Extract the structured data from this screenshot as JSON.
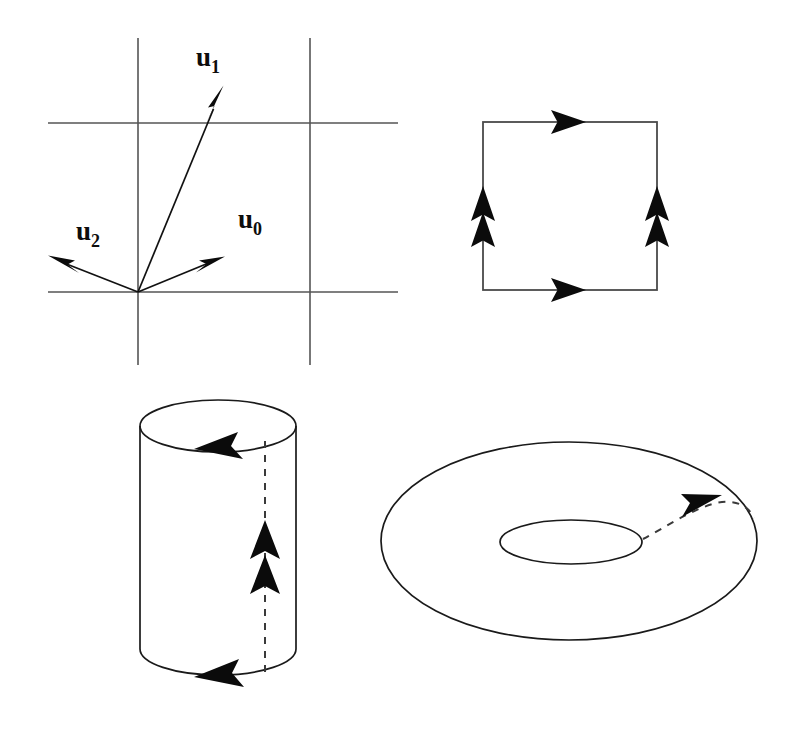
{
  "figure": {
    "background_color": "#ffffff",
    "ink_color": "#111111",
    "grid_color": "#555555",
    "panels": [
      {
        "id": "lattice-vectors",
        "name": "lattice-basis-vectors-panel",
        "position": "top-left",
        "description": "Square grid with three labelled vectors emanating from the origin",
        "grid": {
          "vertical_lines_x": [
            138,
            310
          ],
          "horizontal_lines_y": [
            123,
            292
          ],
          "x_extent": [
            48,
            398
          ],
          "y_extent": [
            38,
            365
          ]
        },
        "origin": [
          138,
          292
        ],
        "vectors": [
          {
            "label": "u",
            "subscript": "0",
            "tip": [
              222,
              258
            ],
            "label_pos": [
              238,
              228
            ]
          },
          {
            "label": "u",
            "subscript": "1",
            "tip": [
              222,
              88
            ],
            "label_pos": [
              196,
              66
            ]
          },
          {
            "label": "u",
            "subscript": "2",
            "tip": [
              50,
              258
            ],
            "label_pos": [
              76,
              240
            ]
          }
        ]
      },
      {
        "id": "identified-square",
        "name": "identified-square-panel",
        "position": "top-right",
        "description": "Square with edge identifications: top and bottom single right arrows, left and right double up arrows",
        "bounds": {
          "left": 483,
          "top": 122,
          "right": 657,
          "bottom": 290
        },
        "edge_markers": [
          {
            "edge": "top",
            "direction": "right",
            "count": 1
          },
          {
            "edge": "bottom",
            "direction": "right",
            "count": 1
          },
          {
            "edge": "left",
            "direction": "up",
            "count": 2
          },
          {
            "edge": "right",
            "direction": "up",
            "count": 2
          }
        ]
      },
      {
        "id": "cylinder",
        "name": "cylinder-panel",
        "position": "bottom-left",
        "description": "Cylinder obtained by gluing the vertical edges; rim arrows point left, dashed seam carries a double up arrow",
        "top_ellipse": {
          "cx": 218,
          "cy": 426,
          "rx": 78,
          "ry": 26
        },
        "bottom_ellipse": {
          "cx": 218,
          "cy": 649,
          "rx": 78,
          "ry": 26
        },
        "seam": {
          "x": 265,
          "top_y": 440,
          "bottom_y": 672,
          "style": "dashed"
        },
        "edge_markers": [
          {
            "edge": "top-rim",
            "direction": "left",
            "count": 1
          },
          {
            "edge": "bottom-rim",
            "direction": "left",
            "count": 1
          },
          {
            "edge": "seam",
            "direction": "up",
            "count": 2
          }
        ]
      },
      {
        "id": "torus",
        "name": "torus-panel",
        "position": "bottom-right",
        "description": "Torus obtained by gluing the cylinder ends; dashed curve with single right arrow marks the identified circle",
        "outer_ellipse": {
          "cx": 569,
          "cy": 541,
          "rx": 188,
          "ry": 99
        },
        "inner_ellipse": {
          "cx": 571,
          "cy": 542,
          "rx": 71,
          "ry": 22
        },
        "seam": {
          "style": "dashed",
          "from": [
            643,
            540
          ],
          "to": [
            752,
            516
          ]
        },
        "edge_markers": [
          {
            "edge": "seam",
            "direction": "right",
            "count": 1
          }
        ]
      }
    ]
  }
}
